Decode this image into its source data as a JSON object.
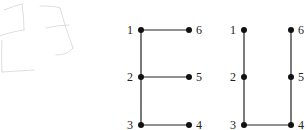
{
  "sketch": {
    "description": "faint pencil sketch of two rounded rectangles",
    "stroke": "#d8d8d8"
  },
  "graphs": [
    {
      "name": "graph-E",
      "nodes": [
        {
          "id": "1",
          "x": 141,
          "y": 30,
          "label_side": "left"
        },
        {
          "id": "2",
          "x": 141,
          "y": 77,
          "label_side": "left"
        },
        {
          "id": "3",
          "x": 141,
          "y": 125,
          "label_side": "left"
        },
        {
          "id": "4",
          "x": 189,
          "y": 125,
          "label_side": "right"
        },
        {
          "id": "5",
          "x": 189,
          "y": 77,
          "label_side": "right"
        },
        {
          "id": "6",
          "x": 189,
          "y": 30,
          "label_side": "right"
        }
      ],
      "edges": [
        [
          "1",
          "2"
        ],
        [
          "2",
          "3"
        ],
        [
          "1",
          "6"
        ],
        [
          "2",
          "5"
        ],
        [
          "3",
          "4"
        ]
      ]
    },
    {
      "name": "graph-U",
      "nodes": [
        {
          "id": "1",
          "x": 244,
          "y": 30,
          "label_side": "left"
        },
        {
          "id": "2",
          "x": 244,
          "y": 77,
          "label_side": "left"
        },
        {
          "id": "3",
          "x": 244,
          "y": 125,
          "label_side": "left"
        },
        {
          "id": "4",
          "x": 291,
          "y": 125,
          "label_side": "right"
        },
        {
          "id": "5",
          "x": 291,
          "y": 77,
          "label_side": "right"
        },
        {
          "id": "6",
          "x": 291,
          "y": 30,
          "label_side": "right"
        }
      ],
      "edges": [
        [
          "1",
          "2"
        ],
        [
          "2",
          "3"
        ],
        [
          "3",
          "4"
        ],
        [
          "4",
          "5"
        ],
        [
          "5",
          "6"
        ]
      ]
    }
  ],
  "style": {
    "edge_color": "#222222",
    "node_color": "#111111",
    "node_radius": 3
  }
}
